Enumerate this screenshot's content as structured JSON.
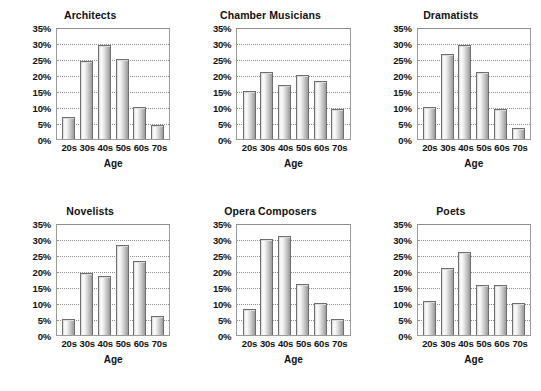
{
  "chart_data": {
    "type": "bar",
    "title": "",
    "xlabel": "Age",
    "ylabel": "",
    "ylim": [
      0,
      35
    ],
    "ytick_labels": [
      "35%",
      "30%",
      "25%",
      "20%",
      "15%",
      "10%",
      "5%",
      "0%"
    ],
    "ytick_values": [
      35,
      30,
      25,
      20,
      15,
      10,
      5,
      0
    ],
    "grid": true,
    "legend": "none",
    "categories": [
      "20s",
      "30s",
      "40s",
      "50s",
      "60s",
      "70s"
    ],
    "panels": [
      {
        "title": "Architects",
        "values": [
          7,
          24.5,
          29.5,
          25,
          10,
          4.5
        ]
      },
      {
        "title": "Chamber Musicians",
        "values": [
          15,
          21,
          17,
          20,
          18,
          9.5
        ]
      },
      {
        "title": "Dramatists",
        "values": [
          10,
          26.5,
          29.5,
          21,
          9.5,
          3.5
        ]
      },
      {
        "title": "Novelists",
        "values": [
          5,
          19.5,
          18.5,
          28,
          23,
          6
        ]
      },
      {
        "title": "Opera Composers",
        "values": [
          8,
          30,
          31,
          16,
          10,
          5
        ]
      },
      {
        "title": "Poets",
        "values": [
          10.5,
          21,
          26,
          15.5,
          15.5,
          10
        ]
      }
    ]
  },
  "colors": {
    "background": "#ffffff",
    "axis": "#9a9a9a",
    "grid": "#8f8f8f",
    "bar_border": "#6e6e6e",
    "text": "#111111"
  }
}
